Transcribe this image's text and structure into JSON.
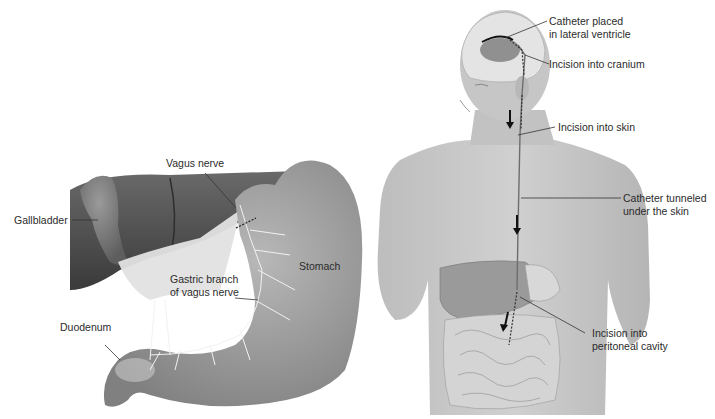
{
  "figure": {
    "left_panel": {
      "subject": "stomach-vagus-nerve",
      "labels": {
        "vagus_nerve": "Vagus nerve",
        "gallbladder": "Gallbladder",
        "stomach": "Stomach",
        "gastric_branch_line1": "Gastric branch",
        "gastric_branch_line2": "of vagus nerve",
        "duodenum": "Duodenum"
      }
    },
    "right_panel": {
      "subject": "ventriculoperitoneal-shunt",
      "labels": {
        "catheter_placed_line1": "Catheter placed",
        "catheter_placed_line2": "in lateral ventricle",
        "incision_cranium": "Incision into cranium",
        "incision_skin": "Incision into skin",
        "catheter_tunneled_line1": "Catheter tunneled",
        "catheter_tunneled_line2": "under the skin",
        "incision_peritoneal_line1": "Incision into",
        "incision_peritoneal_line2": "peritoneal cavity"
      }
    },
    "colors": {
      "background": "#ffffff",
      "label_text": "#2b2b2b",
      "leader_line": "#333333",
      "organ_gray": "#9a9a9a",
      "liver_dark": "#5a5a5a",
      "skin_gray": "#c4c4c4",
      "nerve_white": "#f2f2f2"
    }
  }
}
